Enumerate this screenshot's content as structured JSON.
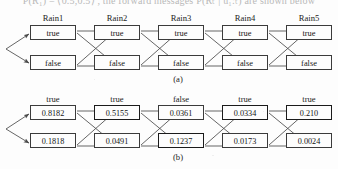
{
  "figure": {
    "top_cut_text": "P(R₁) = ⟨0.5,0.5⟩ , the forward messages P(Rₜ | u₁:ₜ) are shown below",
    "captions": {
      "a": "(a)",
      "b": "(b)"
    },
    "panel_a": {
      "column_labels": [
        "Rain1",
        "Rain2",
        "Rain3",
        "Rain4",
        "Rain5"
      ],
      "row_top_labels": [
        "true",
        "true",
        "true",
        "true",
        "true"
      ],
      "row_bottom_labels": [
        "false",
        "false",
        "false",
        "false",
        "false"
      ]
    },
    "panel_b": {
      "column_labels": [
        "true",
        "true",
        "false",
        "true",
        "true"
      ],
      "row_top_values": [
        "0.8182",
        "0.5155",
        "0.0361",
        "0.0334",
        "0.210"
      ],
      "row_bottom_values": [
        "0.1818",
        "0.0491",
        "0.1237",
        "0.0173",
        "0.0024"
      ],
      "highlighted_top": [
        false,
        true,
        false,
        true,
        true
      ],
      "highlighted_bottom": [
        false,
        false,
        true,
        false,
        false
      ]
    },
    "colors": {
      "box_border": "#3b3b3b",
      "box_border_bold": "#1b1b1b",
      "wire": "#4a4a4a",
      "text": "#141414",
      "background": "#fdfdfd"
    }
  }
}
